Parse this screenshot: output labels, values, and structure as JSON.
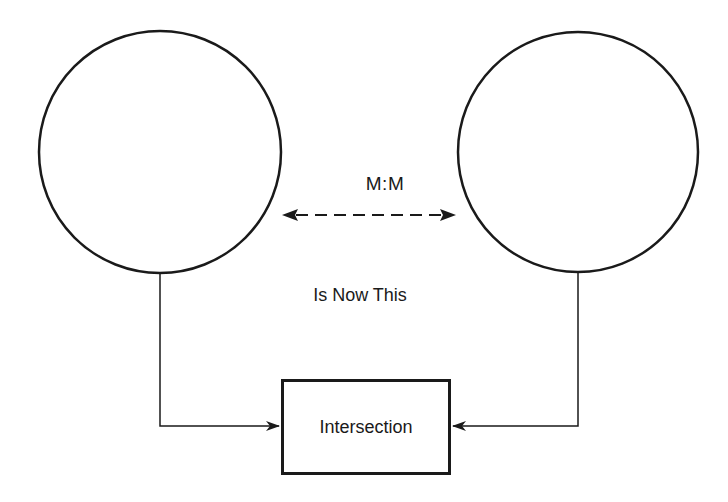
{
  "diagram": {
    "entities": [
      {
        "id": "left-entity",
        "shape": "circle",
        "label": ""
      },
      {
        "id": "right-entity",
        "shape": "circle",
        "label": ""
      }
    ],
    "relationship_label": "M:M",
    "relationship_style": "dashed bidirectional arrow",
    "transition_text": "Is Now This",
    "intersection_label": "Intersection",
    "connectors": [
      {
        "from": "left-entity",
        "to": "intersection",
        "style": "solid arrow"
      },
      {
        "from": "right-entity",
        "to": "intersection",
        "style": "solid arrow"
      }
    ],
    "colors": {
      "stroke": "#1a1a1a",
      "background": "#ffffff"
    }
  }
}
